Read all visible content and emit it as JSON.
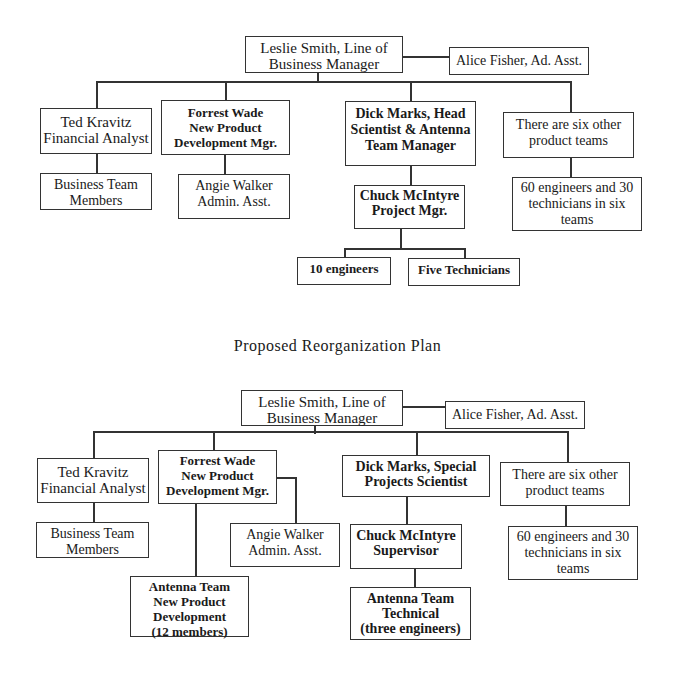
{
  "current_chart": {
    "manager": [
      "Leslie Smith, Line of",
      "Business Manager"
    ],
    "assistant": [
      "Alice Fisher, Ad. Asst."
    ],
    "ted": [
      "Ted Kravitz",
      "Financial Analyst"
    ],
    "business_team": [
      "Business Team",
      "Members"
    ],
    "forrest": [
      "Forrest Wade",
      "New Product",
      "Development Mgr."
    ],
    "angie": [
      "Angie Walker",
      "Admin. Asst."
    ],
    "dick": [
      "Dick Marks, Head",
      "Scientist & Antenna",
      "Team Manager"
    ],
    "chuck": [
      "Chuck McIntyre",
      "Project Mgr."
    ],
    "engineers": [
      "10 engineers"
    ],
    "technicians": [
      "Five Technicians"
    ],
    "other_teams": [
      "There are six other",
      "product teams"
    ],
    "other_staff": [
      "60 engineers and 30",
      "technicians in six teams"
    ]
  },
  "title": "Proposed Reorganization Plan",
  "proposed_chart": {
    "manager": [
      "Leslie Smith, Line of",
      "Business Manager"
    ],
    "assistant": [
      "Alice Fisher, Ad. Asst."
    ],
    "ted": [
      "Ted Kravitz",
      "Financial Analyst"
    ],
    "business_team": [
      "Business Team",
      "Members"
    ],
    "forrest": [
      "Forrest Wade",
      "New Product",
      "Development Mgr."
    ],
    "angie": [
      "Angie Walker",
      "Admin. Asst."
    ],
    "antenna_npd": [
      "Antenna Team",
      "New Product",
      "Development",
      "(12 members)"
    ],
    "dick": [
      "Dick Marks, Special",
      "Projects Scientist"
    ],
    "chuck": [
      "Chuck McIntyre",
      "Supervisor"
    ],
    "antenna_tech": [
      "Antenna Team",
      "Technical",
      "(three engineers)"
    ],
    "other_teams": [
      "There are six other",
      "product teams"
    ],
    "other_staff": [
      "60 engineers and 30",
      "technicians in six teams"
    ]
  }
}
